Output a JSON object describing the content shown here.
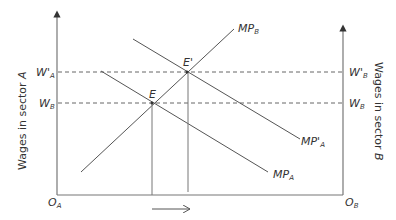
{
  "diagram": {
    "type": "two-sector labor market wage diagram",
    "left_axis_label": "Wages in sector A",
    "left_axis_label_plain": "Wages in sector ",
    "left_axis_label_var": "A",
    "right_axis_label_plain": "Wages in sector ",
    "right_axis_label_var": "B",
    "origin_left": {
      "main": "O",
      "sub": "A"
    },
    "origin_right": {
      "main": "O",
      "sub": "B"
    },
    "wage_levels": [
      {
        "id": "w_prime_a",
        "main": "W'",
        "sub": "A",
        "side": "left"
      },
      {
        "id": "w_b_left",
        "main": "W",
        "sub": "B",
        "side": "left"
      },
      {
        "id": "w_prime_b",
        "main": "W'",
        "sub": "B",
        "side": "right"
      },
      {
        "id": "w_b_right",
        "main": "W",
        "sub": "B",
        "side": "right"
      }
    ],
    "curves": [
      {
        "id": "mp_b",
        "main": "MP",
        "sub": "B"
      },
      {
        "id": "mp_a",
        "main": "MP",
        "sub": "A"
      },
      {
        "id": "mp_prime_a",
        "main": "MP'",
        "sub": "A"
      }
    ],
    "points": [
      {
        "id": "e",
        "label": "E"
      },
      {
        "id": "e_prime",
        "label": "E'"
      }
    ],
    "shift_arrow": "rightward shift of labor allocation",
    "colors": {
      "line": "#555555",
      "text": "#333333",
      "background": "#ffffff"
    }
  }
}
